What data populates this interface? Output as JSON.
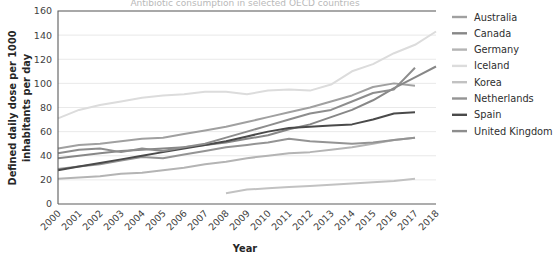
{
  "chart_data": {
    "type": "line",
    "title": "Antibiotic consumption in selected OECD countries",
    "xlabel": "Year",
    "ylabel": "Defined daily dose per 1000 inhabitants per day",
    "x": [
      2000,
      2001,
      2002,
      2003,
      2004,
      2005,
      2006,
      2007,
      2008,
      2009,
      2010,
      2011,
      2012,
      2013,
      2014,
      2015,
      2016,
      2017,
      2018
    ],
    "xlim": [
      2000,
      2018
    ],
    "ylim": [
      0,
      160
    ],
    "yticks": [
      0,
      20,
      40,
      60,
      80,
      100,
      120,
      140,
      160
    ],
    "xticks": [
      "2000",
      "2001",
      "2002",
      "2003",
      "2004",
      "2005",
      "2006",
      "2007",
      "2008",
      "2009",
      "2010",
      "2011",
      "2012",
      "2013",
      "2014",
      "2015",
      "2016",
      "2017",
      "2018"
    ],
    "grid": true,
    "legend_position": "right",
    "series": [
      {
        "name": "Australia",
        "color": "#a0a0a0",
        "x": [
          2000,
          2001,
          2002,
          2003,
          2004,
          2005,
          2006,
          2007,
          2008,
          2009,
          2010,
          2011,
          2012,
          2013,
          2014,
          2015,
          2016,
          2017
        ],
        "values": [
          46,
          49,
          50,
          52,
          54,
          55,
          58,
          61,
          64,
          68,
          72,
          76,
          80,
          85,
          90,
          97,
          100,
          98
        ]
      },
      {
        "name": "Canada",
        "color": "#878787",
        "x": [
          2000,
          2001,
          2002,
          2003,
          2004,
          2005,
          2006,
          2007,
          2008,
          2009,
          2010,
          2011,
          2012,
          2013,
          2014,
          2015,
          2016,
          2017,
          2018
        ],
        "values": [
          38,
          40,
          42,
          44,
          45,
          46,
          47,
          49,
          51,
          54,
          57,
          62,
          66,
          72,
          78,
          86,
          96,
          105,
          114
        ]
      },
      {
        "name": "Germany",
        "color": "#b4b4b4",
        "x": [
          2000,
          2001,
          2002,
          2003,
          2004,
          2005,
          2006,
          2007,
          2008,
          2009,
          2010,
          2011,
          2012,
          2013,
          2014,
          2015,
          2016,
          2017
        ],
        "values": [
          21,
          22,
          23,
          25,
          26,
          28,
          30,
          33,
          35,
          38,
          40,
          42,
          43,
          45,
          47,
          50,
          53,
          55
        ]
      },
      {
        "name": "Iceland",
        "color": "#dcdcdc",
        "x": [
          2000,
          2001,
          2002,
          2003,
          2004,
          2005,
          2006,
          2007,
          2008,
          2009,
          2010,
          2011,
          2012,
          2013,
          2014,
          2015,
          2016,
          2017,
          2018
        ],
        "values": [
          71,
          78,
          82,
          85,
          88,
          90,
          91,
          93,
          93,
          91,
          94,
          95,
          94,
          99,
          110,
          116,
          125,
          132,
          143
        ]
      },
      {
        "name": "Korea",
        "color": "#c2c2c2",
        "x": [
          2008,
          2009,
          2010,
          2011,
          2012,
          2013,
          2014,
          2015,
          2016,
          2017
        ],
        "values": [
          9,
          12,
          13,
          14,
          15,
          16,
          17,
          18,
          19,
          21
        ]
      },
      {
        "name": "Netherlands",
        "color": "#949494",
        "x": [
          2000,
          2001,
          2002,
          2003,
          2004,
          2005,
          2006,
          2007,
          2008,
          2009,
          2010,
          2011,
          2012,
          2013,
          2014,
          2015,
          2016,
          2017
        ],
        "values": [
          29,
          31,
          33,
          36,
          39,
          38,
          41,
          44,
          47,
          49,
          51,
          54,
          52,
          51,
          50,
          51,
          53,
          55
        ]
      },
      {
        "name": "Spain",
        "color": "#4a4a4a",
        "x": [
          2000,
          2001,
          2002,
          2003,
          2004,
          2005,
          2006,
          2007,
          2008,
          2009,
          2010,
          2011,
          2012,
          2013,
          2014,
          2015,
          2016,
          2017
        ],
        "values": [
          28,
          31,
          34,
          37,
          40,
          43,
          46,
          49,
          52,
          56,
          60,
          63,
          64,
          65,
          66,
          70,
          75,
          76
        ]
      },
      {
        "name": "United Kingdom",
        "color": "#8d8d8d",
        "x": [
          2000,
          2001,
          2002,
          2003,
          2004,
          2005,
          2006,
          2007,
          2008,
          2009,
          2010,
          2011,
          2012,
          2013,
          2014,
          2015,
          2016,
          2017
        ],
        "values": [
          42,
          45,
          46,
          43,
          46,
          44,
          47,
          50,
          55,
          60,
          65,
          70,
          75,
          78,
          85,
          92,
          95,
          113
        ]
      }
    ]
  },
  "axes": {
    "x_title": "Year",
    "y_title_line1": "Defined daily dose per 1000",
    "y_title_line2": "inhabitants per day"
  },
  "legend": {
    "items": [
      {
        "label": "Australia"
      },
      {
        "label": "Canada"
      },
      {
        "label": "Germany"
      },
      {
        "label": "Iceland"
      },
      {
        "label": "Korea"
      },
      {
        "label": "Netherlands"
      },
      {
        "label": "Spain"
      },
      {
        "label": "United Kingdom"
      }
    ]
  }
}
